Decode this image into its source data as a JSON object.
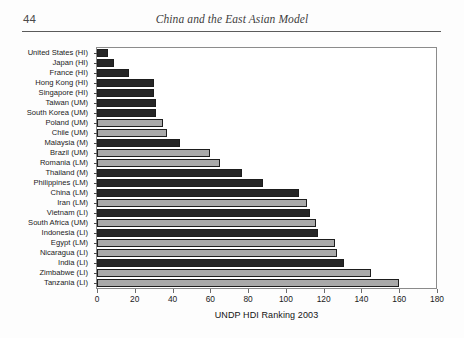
{
  "page": {
    "folio": "44",
    "running_title": "China and the East Asian Model"
  },
  "chart_data": {
    "type": "bar",
    "orientation": "horizontal",
    "title": "",
    "subtitle": "",
    "xlabel": "UNDP HDI Ranking 2003",
    "ylabel": "",
    "xlim": [
      0,
      180
    ],
    "ylim": null,
    "xticks": [
      0,
      20,
      40,
      60,
      80,
      100,
      120,
      140,
      160,
      180
    ],
    "xtick_labels": [
      "0",
      "20",
      "40",
      "60",
      "80",
      "100",
      "120",
      "140",
      "160",
      "180"
    ],
    "grid": false,
    "legend": null,
    "series_colors": {
      "dark": "#262626",
      "light": "#a9a9a9"
    },
    "categories": [
      "United States (HI)",
      "Japan (HI)",
      "France (HI)",
      "Hong Kong (HI)",
      "Singapore (HI)",
      "Taiwan (UM)",
      "South Korea (UM)",
      "Poland (UM)",
      "Chile (UM)",
      "Malaysia (M)",
      "Brazil (UM)",
      "Romania (LM)",
      "Thailand (M)",
      "Philippines (LM)",
      "China (LM)",
      "Iran (LM)",
      "Vietnam (LI)",
      "South Africa (UM)",
      "Indonesia (LI)",
      "Egypt (LM)",
      "Nicaragua (LI)",
      "India (LI)",
      "Zimbabwe (LI)",
      "Tanzania (LI)"
    ],
    "values": [
      6,
      9,
      17,
      30,
      30,
      31,
      31,
      35,
      37,
      44,
      60,
      65,
      77,
      88,
      107,
      111,
      113,
      116,
      117,
      126,
      127,
      131,
      145,
      160
    ],
    "shades": [
      "dark",
      "dark",
      "dark",
      "dark",
      "dark",
      "dark",
      "dark",
      "light",
      "light",
      "dark",
      "light",
      "light",
      "dark",
      "dark",
      "dark",
      "light",
      "dark",
      "light",
      "dark",
      "light",
      "light",
      "dark",
      "light",
      "light"
    ]
  }
}
